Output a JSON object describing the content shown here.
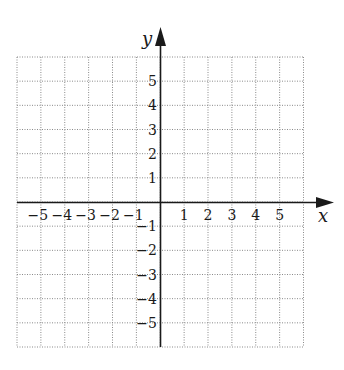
{
  "chart_data": {
    "type": "scatter",
    "title": "",
    "xlabel": "x",
    "ylabel": "y",
    "xlim": [
      -6,
      6
    ],
    "ylim": [
      -6,
      6
    ],
    "grid": true,
    "grid_style": "dotted",
    "x_tick_labels": [
      "−5",
      "−4",
      "−3",
      "−2",
      "−1",
      "1",
      "2",
      "3",
      "4",
      "5"
    ],
    "x_ticks": [
      -5,
      -4,
      -3,
      -2,
      -1,
      1,
      2,
      3,
      4,
      5
    ],
    "y_tick_labels": [
      "5",
      "4",
      "3",
      "2",
      "1",
      "−1",
      "−2",
      "−3",
      "−4",
      "−5"
    ],
    "y_ticks": [
      5,
      4,
      3,
      2,
      1,
      -1,
      -2,
      -3,
      -4,
      -5
    ],
    "series": [],
    "legend": null
  },
  "colors": {
    "axis": "#1a1a1a",
    "grid": "#8a8a8a",
    "background": "#ffffff"
  }
}
